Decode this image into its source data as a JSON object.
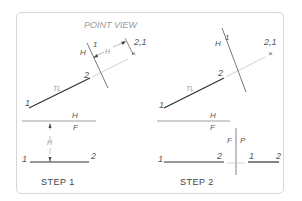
{
  "title": "POINT VIEW",
  "colors": {
    "frame": "#d6d6d6",
    "line_dark": "#333333",
    "line_light": "#bdbdbd",
    "text": "#555555",
    "text_light": "#9a9a9a"
  },
  "step1": {
    "caption": "STEP 1",
    "true_length_label": "TL",
    "point1_label": "1",
    "point2_label": "2",
    "fold_label_left": "H",
    "fold_label_right": "1",
    "point_view_label": "2,1",
    "dimension_label_aux": "H",
    "hf_top_label": "H",
    "hf_bottom_label": "F",
    "dimension_label_front": "H",
    "front_point1_label": "1",
    "front_point2_label": "2"
  },
  "step2": {
    "caption": "STEP 2",
    "true_length_label": "TL",
    "point1_label": "1",
    "point2_label": "2",
    "fold_label_left": "H",
    "fold_label_right": "1",
    "point_view_label": "2,1",
    "hf_top_label": "H",
    "hf_bottom_label": "F",
    "fp_left_label": "F",
    "fp_right_label": "P",
    "front_point1_label": "1",
    "front_point2_label": "2",
    "profile_point1_label": "1",
    "profile_point2_label": "2"
  }
}
